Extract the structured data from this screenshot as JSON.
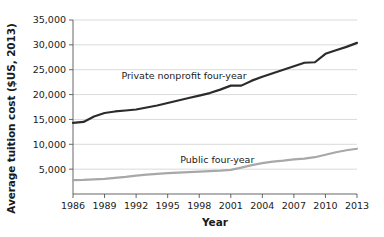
{
  "chart_data": {
    "type": "line",
    "title": "",
    "xlabel": "Year",
    "ylabel": "Average tuition cost ($US, 2013)",
    "xlim": [
      1986,
      2013
    ],
    "ylim": [
      0,
      35000
    ],
    "grid": true,
    "legend_position": "inline-annotation",
    "ytick_labels": [
      "5,000",
      "10,000",
      "15,000",
      "20,000",
      "25,000",
      "30,000",
      "35,000"
    ],
    "ytick_values": [
      5000,
      10000,
      15000,
      20000,
      25000,
      30000,
      35000
    ],
    "xtick_labels": [
      "1986",
      "1989",
      "1992",
      "1995",
      "1998",
      "2001",
      "2004",
      "2007",
      "2010",
      "2013"
    ],
    "xtick_values": [
      1986,
      1989,
      1992,
      1995,
      1998,
      2001,
      2004,
      2007,
      2010,
      2013
    ],
    "x": [
      1986,
      1987,
      1988,
      1989,
      1990,
      1991,
      1992,
      1993,
      1994,
      1995,
      1996,
      1997,
      1998,
      1999,
      2000,
      2001,
      2002,
      2003,
      2004,
      2005,
      2006,
      2007,
      2008,
      2009,
      2010,
      2011,
      2012,
      2013
    ],
    "series": [
      {
        "name": "Private nonprofit four-year",
        "color": "#2b2b2b",
        "width": 2.2,
        "label_x": 1990.6,
        "label_y": 23100,
        "values": [
          14300,
          14500,
          15600,
          16300,
          16600,
          16800,
          17000,
          17400,
          17800,
          18300,
          18800,
          19300,
          19800,
          20300,
          21000,
          21800,
          21800,
          22800,
          23600,
          24300,
          25000,
          25700,
          26400,
          26500,
          28200,
          28900,
          29600,
          30400
        ]
      },
      {
        "name": "Public four-year",
        "color": "#a8a8a8",
        "width": 2.2,
        "label_x": 1996.2,
        "label_y": 6300,
        "values": [
          2800,
          2850,
          2950,
          3050,
          3250,
          3450,
          3700,
          3900,
          4050,
          4200,
          4300,
          4400,
          4500,
          4600,
          4700,
          4850,
          5300,
          5800,
          6200,
          6500,
          6700,
          6950,
          7100,
          7400,
          7900,
          8400,
          8800,
          9100
        ]
      }
    ]
  }
}
